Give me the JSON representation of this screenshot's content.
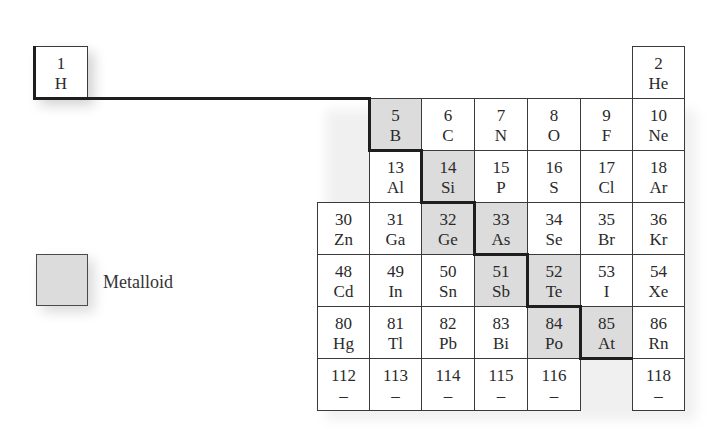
{
  "colors": {
    "metalloid_fill": "#dcdcdc",
    "cell_fill": "#ffffff",
    "border": "#3a3a3a",
    "staircase_line": "#1e1e1e"
  },
  "legend": {
    "label": "Metalloid",
    "swatch_color": "#dcdcdc"
  },
  "elements": [
    {
      "number": "1",
      "symbol": "H",
      "metalloid": false,
      "col": -1,
      "row": 0
    },
    {
      "number": "2",
      "symbol": "He",
      "metalloid": false,
      "col": 6,
      "row": 0
    },
    {
      "number": "5",
      "symbol": "B",
      "metalloid": true,
      "col": 1,
      "row": 1
    },
    {
      "number": "6",
      "symbol": "C",
      "metalloid": false,
      "col": 2,
      "row": 1
    },
    {
      "number": "7",
      "symbol": "N",
      "metalloid": false,
      "col": 3,
      "row": 1
    },
    {
      "number": "8",
      "symbol": "O",
      "metalloid": false,
      "col": 4,
      "row": 1
    },
    {
      "number": "9",
      "symbol": "F",
      "metalloid": false,
      "col": 5,
      "row": 1
    },
    {
      "number": "10",
      "symbol": "Ne",
      "metalloid": false,
      "col": 6,
      "row": 1
    },
    {
      "number": "13",
      "symbol": "Al",
      "metalloid": false,
      "col": 1,
      "row": 2
    },
    {
      "number": "14",
      "symbol": "Si",
      "metalloid": true,
      "col": 2,
      "row": 2
    },
    {
      "number": "15",
      "symbol": "P",
      "metalloid": false,
      "col": 3,
      "row": 2
    },
    {
      "number": "16",
      "symbol": "S",
      "metalloid": false,
      "col": 4,
      "row": 2
    },
    {
      "number": "17",
      "symbol": "Cl",
      "metalloid": false,
      "col": 5,
      "row": 2
    },
    {
      "number": "18",
      "symbol": "Ar",
      "metalloid": false,
      "col": 6,
      "row": 2
    },
    {
      "number": "30",
      "symbol": "Zn",
      "metalloid": false,
      "col": 0,
      "row": 3
    },
    {
      "number": "31",
      "symbol": "Ga",
      "metalloid": false,
      "col": 1,
      "row": 3
    },
    {
      "number": "32",
      "symbol": "Ge",
      "metalloid": true,
      "col": 2,
      "row": 3
    },
    {
      "number": "33",
      "symbol": "As",
      "metalloid": true,
      "col": 3,
      "row": 3
    },
    {
      "number": "34",
      "symbol": "Se",
      "metalloid": false,
      "col": 4,
      "row": 3
    },
    {
      "number": "35",
      "symbol": "Br",
      "metalloid": false,
      "col": 5,
      "row": 3
    },
    {
      "number": "36",
      "symbol": "Kr",
      "metalloid": false,
      "col": 6,
      "row": 3
    },
    {
      "number": "48",
      "symbol": "Cd",
      "metalloid": false,
      "col": 0,
      "row": 4
    },
    {
      "number": "49",
      "symbol": "In",
      "metalloid": false,
      "col": 1,
      "row": 4
    },
    {
      "number": "50",
      "symbol": "Sn",
      "metalloid": false,
      "col": 2,
      "row": 4
    },
    {
      "number": "51",
      "symbol": "Sb",
      "metalloid": true,
      "col": 3,
      "row": 4
    },
    {
      "number": "52",
      "symbol": "Te",
      "metalloid": true,
      "col": 4,
      "row": 4
    },
    {
      "number": "53",
      "symbol": "I",
      "metalloid": false,
      "col": 5,
      "row": 4
    },
    {
      "number": "54",
      "symbol": "Xe",
      "metalloid": false,
      "col": 6,
      "row": 4
    },
    {
      "number": "80",
      "symbol": "Hg",
      "metalloid": false,
      "col": 0,
      "row": 5
    },
    {
      "number": "81",
      "symbol": "Tl",
      "metalloid": false,
      "col": 1,
      "row": 5
    },
    {
      "number": "82",
      "symbol": "Pb",
      "metalloid": false,
      "col": 2,
      "row": 5
    },
    {
      "number": "83",
      "symbol": "Bi",
      "metalloid": false,
      "col": 3,
      "row": 5
    },
    {
      "number": "84",
      "symbol": "Po",
      "metalloid": true,
      "col": 4,
      "row": 5
    },
    {
      "number": "85",
      "symbol": "At",
      "metalloid": true,
      "col": 5,
      "row": 5
    },
    {
      "number": "86",
      "symbol": "Rn",
      "metalloid": false,
      "col": 6,
      "row": 5
    },
    {
      "number": "112",
      "symbol": "–",
      "metalloid": false,
      "col": 0,
      "row": 6
    },
    {
      "number": "113",
      "symbol": "–",
      "metalloid": false,
      "col": 1,
      "row": 6
    },
    {
      "number": "114",
      "symbol": "–",
      "metalloid": false,
      "col": 2,
      "row": 6
    },
    {
      "number": "115",
      "symbol": "–",
      "metalloid": false,
      "col": 3,
      "row": 6
    },
    {
      "number": "116",
      "symbol": "–",
      "metalloid": false,
      "col": 4,
      "row": 6
    },
    {
      "number": "118",
      "symbol": "–",
      "metalloid": false,
      "col": 6,
      "row": 6
    }
  ]
}
